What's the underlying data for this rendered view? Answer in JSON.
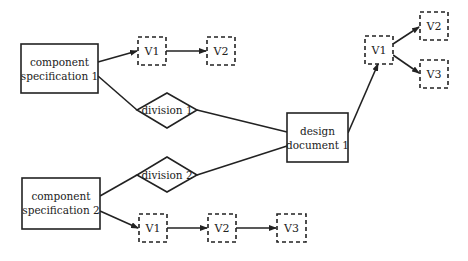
{
  "diagram": {
    "nodes": {
      "spec1": {
        "line1": "component",
        "line2": "specification 1"
      },
      "spec2": {
        "line1": "component",
        "line2": "specification 2"
      },
      "div1": {
        "label": "division 1"
      },
      "div2": {
        "label": "division 2"
      },
      "design": {
        "line1": "design",
        "line2": "document 1"
      },
      "s1v1": {
        "label": "V1"
      },
      "s1v2": {
        "label": "V2"
      },
      "s2v1": {
        "label": "V1"
      },
      "s2v2": {
        "label": "V2"
      },
      "s2v3": {
        "label": "V3"
      },
      "dv1": {
        "label": "V1"
      },
      "dv2": {
        "label": "V2"
      },
      "dv3": {
        "label": "V3"
      }
    },
    "edges": [
      {
        "from": "spec1",
        "to": "s1v1",
        "arrow": true
      },
      {
        "from": "s1v1",
        "to": "s1v2",
        "arrow": true
      },
      {
        "from": "spec1",
        "to": "div1",
        "arrow": false
      },
      {
        "from": "div1",
        "to": "design",
        "arrow": false
      },
      {
        "from": "spec2",
        "to": "div2",
        "arrow": false
      },
      {
        "from": "div2",
        "to": "design",
        "arrow": false
      },
      {
        "from": "spec2",
        "to": "s2v1",
        "arrow": true
      },
      {
        "from": "s2v1",
        "to": "s2v2",
        "arrow": true
      },
      {
        "from": "s2v2",
        "to": "s2v3",
        "arrow": true
      },
      {
        "from": "design",
        "to": "dv1",
        "arrow": true
      },
      {
        "from": "dv1",
        "to": "dv2",
        "arrow": true
      },
      {
        "from": "dv1",
        "to": "dv3",
        "arrow": true
      }
    ],
    "colors": {
      "stroke": "#222222",
      "background": "#ffffff"
    }
  }
}
